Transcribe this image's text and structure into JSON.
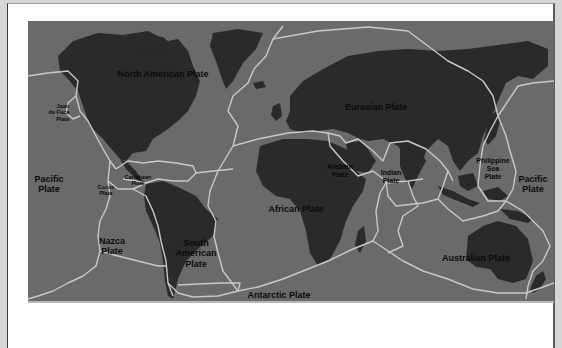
{
  "diagram": {
    "colors": {
      "page_background": "#d6d6d6",
      "card_background": "#ffffff",
      "ocean": "#6a6a6a",
      "land": "#2a2a2a",
      "plate_boundary": "#c8c8c8",
      "label_text": "#0a0a0a"
    },
    "plates": [
      {
        "id": "north-american",
        "lines": [
          "North American Plate"
        ]
      },
      {
        "id": "juan-de-fuca",
        "lines": [
          "Juan",
          "de Fuca",
          "Plate"
        ]
      },
      {
        "id": "eurasian",
        "lines": [
          "Eurasian Plate"
        ]
      },
      {
        "id": "pacific-west",
        "lines": [
          "Pacific",
          "Plate"
        ]
      },
      {
        "id": "caribbean",
        "lines": [
          "Caribbean",
          "Plate"
        ]
      },
      {
        "id": "cocos",
        "lines": [
          "Cocos",
          "Plate"
        ]
      },
      {
        "id": "arabian",
        "lines": [
          "Arabian",
          "Plate"
        ]
      },
      {
        "id": "indian",
        "lines": [
          "Indian",
          "Plate"
        ]
      },
      {
        "id": "philippine-sea",
        "lines": [
          "Philippine",
          "Sea",
          "Plate"
        ]
      },
      {
        "id": "pacific-east",
        "lines": [
          "Pacific",
          "Plate"
        ]
      },
      {
        "id": "nazca",
        "lines": [
          "Nazca",
          "Plate"
        ]
      },
      {
        "id": "south-american",
        "lines": [
          "South",
          "American",
          "Plate"
        ]
      },
      {
        "id": "african",
        "lines": [
          "African Plate"
        ]
      },
      {
        "id": "australian",
        "lines": [
          "Australian Plate"
        ]
      },
      {
        "id": "scotia",
        "lines": [
          "Scotia Plate"
        ]
      },
      {
        "id": "antarctic",
        "lines": [
          "Antarctic Plate"
        ]
      }
    ]
  }
}
